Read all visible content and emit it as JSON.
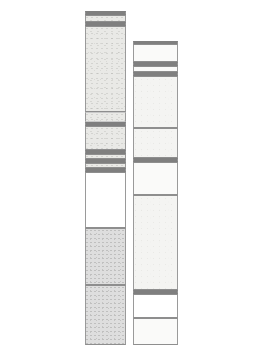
{
  "figure": {
    "type": "stratigraphic-column-diagram",
    "title": "",
    "background_color": "#ffffff",
    "canvas": {
      "width": 253,
      "height": 364
    },
    "palette": {
      "outline": "#8e8e8e",
      "divider": "#7f7f7f",
      "faint_divider": "#c9c9c9",
      "shaded_fill": "#e9e9e6",
      "dark_band_fill": "#d2d2d2",
      "pale_fill": "#f4f4f2",
      "white_fill": "#ffffff"
    }
  },
  "columns": [
    {
      "id": "column-left",
      "label": "",
      "x": 85,
      "width": 41,
      "top": 11,
      "bottom": 345,
      "beds": [
        {
          "name": "bed-l-01",
          "top": 11,
          "height": 4,
          "fill": "fill-band",
          "style": "thin-divider"
        },
        {
          "name": "bed-l-02",
          "top": 15,
          "height": 7,
          "fill": "fill-shaded",
          "style": ""
        },
        {
          "name": "bed-l-03",
          "top": 22,
          "height": 4,
          "fill": "fill-band",
          "style": "thin-divider"
        },
        {
          "name": "bed-l-04",
          "top": 26,
          "height": 86,
          "fill": "fill-shaded",
          "style": ""
        },
        {
          "name": "bed-l-05",
          "top": 112,
          "height": 10,
          "fill": "fill-shaded",
          "style": "faint-line"
        },
        {
          "name": "bed-l-06",
          "top": 122,
          "height": 4,
          "fill": "fill-band",
          "style": "thin-divider"
        },
        {
          "name": "bed-l-07",
          "top": 126,
          "height": 24,
          "fill": "fill-shaded",
          "style": ""
        },
        {
          "name": "bed-l-08",
          "top": 150,
          "height": 4,
          "fill": "fill-band",
          "style": "thin-divider"
        },
        {
          "name": "bed-l-09",
          "top": 154,
          "height": 5,
          "fill": "fill-shaded",
          "style": ""
        },
        {
          "name": "bed-l-10",
          "top": 159,
          "height": 4,
          "fill": "fill-band",
          "style": "thin-divider"
        },
        {
          "name": "bed-l-11",
          "top": 163,
          "height": 5,
          "fill": "fill-shaded",
          "style": ""
        },
        {
          "name": "bed-l-12",
          "top": 168,
          "height": 4,
          "fill": "fill-band",
          "style": "thin-divider"
        },
        {
          "name": "bed-l-13",
          "top": 172,
          "height": 56,
          "fill": "fill-white",
          "style": ""
        },
        {
          "name": "bed-l-14",
          "top": 228,
          "height": 57,
          "fill": "fill-shaded-dark",
          "style": ""
        },
        {
          "name": "bed-l-15",
          "top": 285,
          "height": 60,
          "fill": "fill-shaded-dark",
          "style": ""
        }
      ]
    },
    {
      "id": "column-right",
      "label": "",
      "x": 133,
      "width": 45,
      "top": 41,
      "bottom": 345,
      "beds": [
        {
          "name": "bed-r-01",
          "top": 41,
          "height": 3,
          "fill": "fill-band",
          "style": "thin-divider"
        },
        {
          "name": "bed-r-02",
          "top": 44,
          "height": 18,
          "fill": "fill-vpale",
          "style": ""
        },
        {
          "name": "bed-r-03",
          "top": 62,
          "height": 4,
          "fill": "fill-band",
          "style": "thin-divider"
        },
        {
          "name": "bed-r-04",
          "top": 66,
          "height": 6,
          "fill": "fill-vpale",
          "style": ""
        },
        {
          "name": "bed-r-05",
          "top": 72,
          "height": 4,
          "fill": "fill-band",
          "style": "thin-divider"
        },
        {
          "name": "bed-r-06",
          "top": 76,
          "height": 52,
          "fill": "fill-pale",
          "style": ""
        },
        {
          "name": "bed-r-07",
          "top": 128,
          "height": 30,
          "fill": "fill-pale",
          "style": ""
        },
        {
          "name": "bed-r-08",
          "top": 158,
          "height": 4,
          "fill": "fill-band",
          "style": "thin-divider"
        },
        {
          "name": "bed-r-09",
          "top": 162,
          "height": 33,
          "fill": "fill-vpale",
          "style": ""
        },
        {
          "name": "bed-r-10",
          "top": 195,
          "height": 95,
          "fill": "fill-pale",
          "style": ""
        },
        {
          "name": "bed-r-11",
          "top": 290,
          "height": 4,
          "fill": "fill-band",
          "style": "thin-divider"
        },
        {
          "name": "bed-r-12",
          "top": 294,
          "height": 24,
          "fill": "fill-white",
          "style": ""
        },
        {
          "name": "bed-r-13",
          "top": 318,
          "height": 27,
          "fill": "fill-vpale",
          "style": ""
        }
      ]
    }
  ]
}
